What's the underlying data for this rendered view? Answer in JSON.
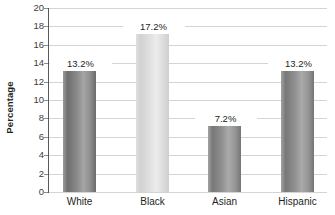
{
  "chart_data": {
    "type": "bar",
    "title": "",
    "xlabel": "",
    "ylabel": "Percentage",
    "categories": [
      "White",
      "Black",
      "Asian",
      "Hispanic"
    ],
    "values": [
      13.2,
      17.2,
      7.2,
      13.2
    ],
    "value_labels": [
      "13.2%",
      "17.2%",
      "7.2%",
      "13.2%"
    ],
    "ylim": [
      0,
      20
    ],
    "ytick_step": 2,
    "ytick_labels": [
      "20",
      "18",
      "16",
      "14",
      "12",
      "10",
      "8",
      "6",
      "4",
      "2",
      "0"
    ],
    "ytick_values": [
      20,
      18,
      16,
      14,
      12,
      10,
      8,
      6,
      4,
      2,
      0
    ],
    "grid": true,
    "grid_axis": "y",
    "legend": false,
    "legend_position": "none",
    "series": [
      {
        "name": "Percentage",
        "values": [
          13.2,
          17.2,
          7.2,
          13.2
        ]
      }
    ],
    "bar_colors": [
      "#8a8a8a",
      "#e0e0e0",
      "#909090",
      "#909090"
    ],
    "colors": {
      "gridline": "#d4d4d4",
      "axis": "#58595b",
      "text": "#231f20",
      "tick_text": "#3c3c3c",
      "background": "#ffffff"
    }
  }
}
